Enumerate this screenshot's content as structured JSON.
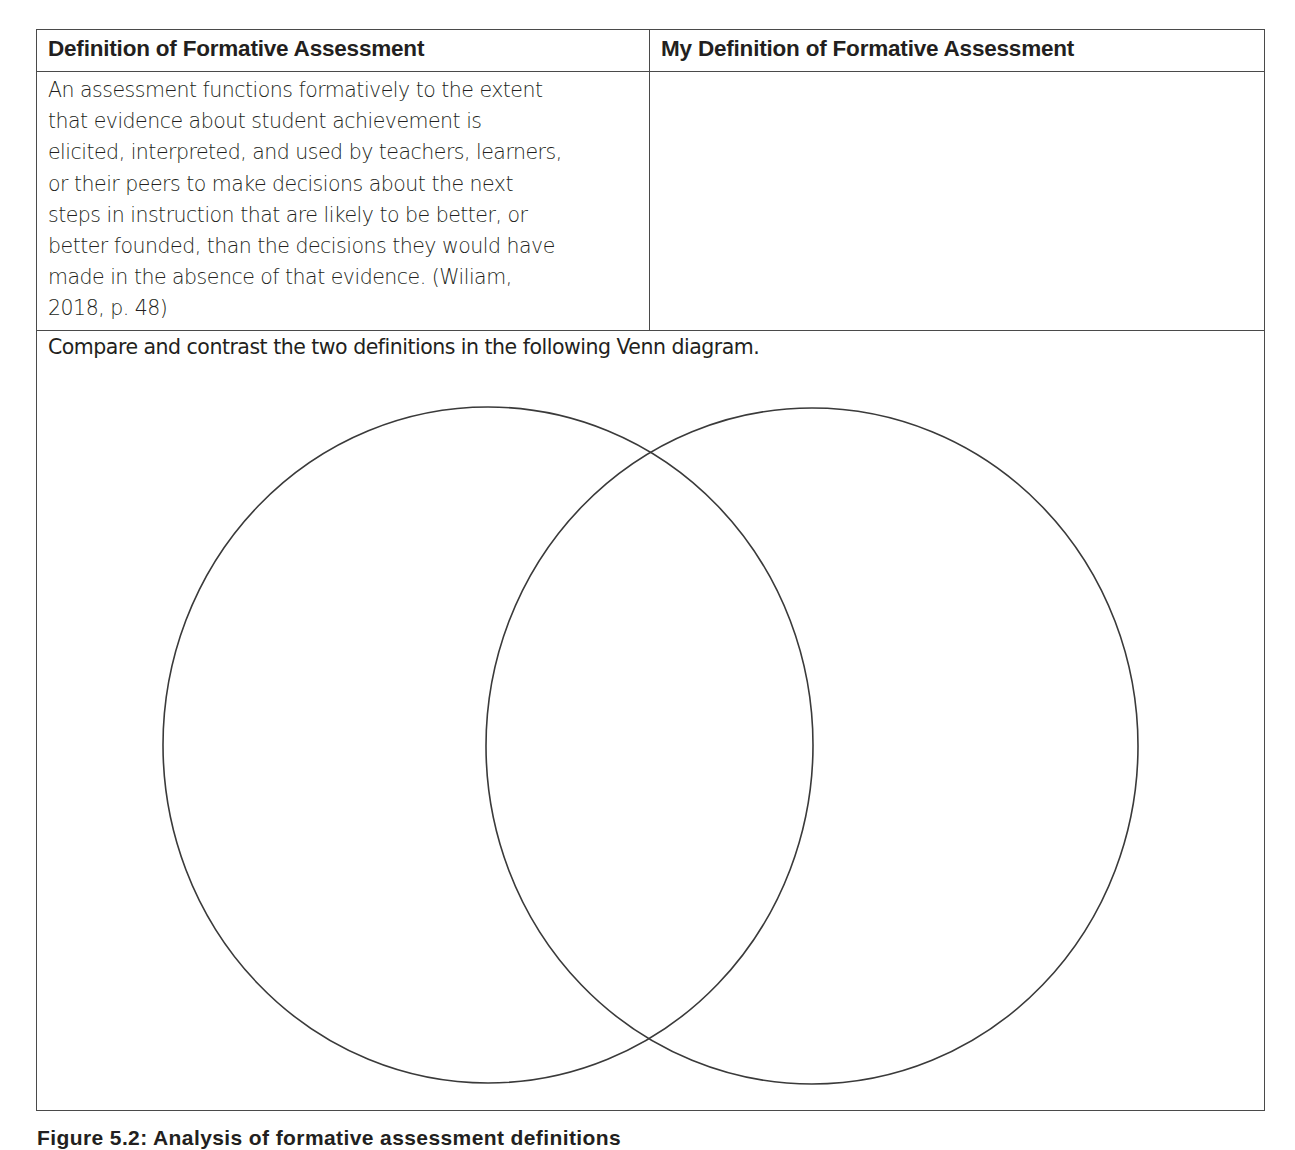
{
  "table": {
    "headers": [
      "Definition of Formative Assessment",
      "My Definition of Formative Assessment"
    ],
    "definition": {
      "text": "An assessment functions formatively to the extent that evidence about student achievement is elicited, interpreted, and used by teachers, learners, or their peers to make decisions about the next steps in instruction that are likely to be better, or better founded, than the decisions they would have made in the absence of that evidence. (Wiliam, 2018, p. 48)",
      "lines": [
        "An assessment functions formatively to the extent",
        "that evidence about student achievement is",
        "elicited, interpreted, and used by teachers, learners,",
        "or their peers to make decisions about the next",
        "steps in instruction that are likely to be better, or",
        "better founded, than the decisions they would have",
        "made in the absence of that evidence. (Wiliam,",
        "2018, p. 48)"
      ]
    },
    "my_definition": {
      "value": "",
      "placeholder": ""
    },
    "venn_prompt": "Compare and contrast the two definitions in the following Venn diagram."
  },
  "venn": {
    "circles": [
      {
        "name": "left-circle",
        "cx": 451,
        "cy": 414,
        "rx": 325,
        "ry": 338
      },
      {
        "name": "right-circle",
        "cx": 775,
        "cy": 415,
        "rx": 326,
        "ry": 338
      }
    ],
    "stroke_color": "#3a3a3a"
  },
  "caption": {
    "text": "Figure 5.2: Analysis of formative assessment definitions"
  },
  "colors": {
    "border": "#4a4a4a",
    "text": "#231f20",
    "background": "#ffffff"
  }
}
